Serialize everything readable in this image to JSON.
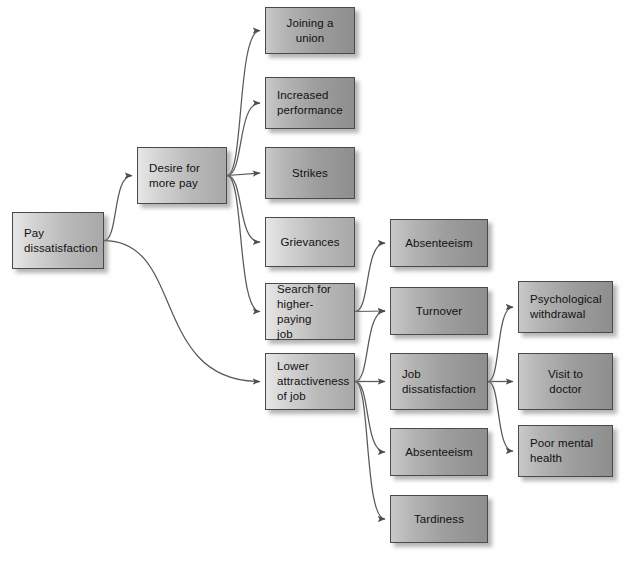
{
  "diagram": {
    "type": "flowchart",
    "box_fill_light": "#d8d8d8",
    "box_fill_dark": "#a8a8a8",
    "box_border": "#4a4a4a",
    "connector_color": "#555555",
    "background": "#ffffff",
    "nodes": [
      {
        "id": "pay_dissatisfaction",
        "label": "Pay\ndissatisfaction",
        "x": 12,
        "y": 212,
        "w": 92,
        "h": 57,
        "shade": "light",
        "align": "left"
      },
      {
        "id": "desire_more_pay",
        "label": "Desire for\nmore pay",
        "x": 137,
        "y": 147,
        "w": 90,
        "h": 57,
        "shade": "light",
        "align": "left"
      },
      {
        "id": "joining_union",
        "label": "Joining a union",
        "x": 265,
        "y": 7,
        "w": 90,
        "h": 47,
        "shade": "dark",
        "align": "center"
      },
      {
        "id": "increased_performance",
        "label": "Increased\nperformance",
        "x": 265,
        "y": 77,
        "w": 90,
        "h": 52,
        "shade": "dark",
        "align": "left"
      },
      {
        "id": "strikes",
        "label": "Strikes",
        "x": 265,
        "y": 147,
        "w": 90,
        "h": 52,
        "shade": "dark",
        "align": "center"
      },
      {
        "id": "grievances",
        "label": "Grievances",
        "x": 265,
        "y": 217,
        "w": 90,
        "h": 50,
        "shade": "light",
        "align": "center"
      },
      {
        "id": "search_higher_paying_job",
        "label": "Search for\nhigher-paying\njob",
        "x": 265,
        "y": 283,
        "w": 90,
        "h": 57,
        "shade": "light",
        "align": "left"
      },
      {
        "id": "lower_attractiveness_of_job",
        "label": "Lower\nattractiveness\nof job",
        "x": 265,
        "y": 353,
        "w": 90,
        "h": 57,
        "shade": "light",
        "align": "left"
      },
      {
        "id": "absenteeism_1",
        "label": "Absenteeism",
        "x": 390,
        "y": 219,
        "w": 98,
        "h": 48,
        "shade": "dark",
        "align": "center"
      },
      {
        "id": "turnover",
        "label": "Turnover",
        "x": 390,
        "y": 287,
        "w": 98,
        "h": 48,
        "shade": "dark",
        "align": "center"
      },
      {
        "id": "job_dissatisfaction",
        "label": "Job\ndissatisfaction",
        "x": 390,
        "y": 353,
        "w": 98,
        "h": 57,
        "shade": "dark",
        "align": "left"
      },
      {
        "id": "absenteeism_2",
        "label": "Absenteeism",
        "x": 390,
        "y": 428,
        "w": 98,
        "h": 48,
        "shade": "dark",
        "align": "center"
      },
      {
        "id": "tardiness",
        "label": "Tardiness",
        "x": 390,
        "y": 495,
        "w": 98,
        "h": 48,
        "shade": "dark",
        "align": "center"
      },
      {
        "id": "psychological_withdrawal",
        "label": "Psychological\nwithdrawal",
        "x": 518,
        "y": 281,
        "w": 95,
        "h": 52,
        "shade": "dark",
        "align": "left"
      },
      {
        "id": "visit_to_doctor",
        "label": "Visit to\ndoctor",
        "x": 518,
        "y": 353,
        "w": 95,
        "h": 57,
        "shade": "dark",
        "align": "center"
      },
      {
        "id": "poor_mental_health",
        "label": "Poor mental\nhealth",
        "x": 518,
        "y": 425,
        "w": 95,
        "h": 52,
        "shade": "dark",
        "align": "left"
      }
    ],
    "edges": [
      {
        "from": "pay_dissatisfaction",
        "to": "desire_more_pay"
      },
      {
        "from": "pay_dissatisfaction",
        "to": "lower_attractiveness_of_job"
      },
      {
        "from": "desire_more_pay",
        "to": "joining_union"
      },
      {
        "from": "desire_more_pay",
        "to": "increased_performance"
      },
      {
        "from": "desire_more_pay",
        "to": "strikes"
      },
      {
        "from": "desire_more_pay",
        "to": "grievances"
      },
      {
        "from": "desire_more_pay",
        "to": "search_higher_paying_job"
      },
      {
        "from": "search_higher_paying_job",
        "to": "absenteeism_1"
      },
      {
        "from": "search_higher_paying_job",
        "to": "turnover"
      },
      {
        "from": "lower_attractiveness_of_job",
        "to": "turnover"
      },
      {
        "from": "lower_attractiveness_of_job",
        "to": "job_dissatisfaction"
      },
      {
        "from": "lower_attractiveness_of_job",
        "to": "absenteeism_2"
      },
      {
        "from": "lower_attractiveness_of_job",
        "to": "tardiness"
      },
      {
        "from": "job_dissatisfaction",
        "to": "psychological_withdrawal"
      },
      {
        "from": "job_dissatisfaction",
        "to": "visit_to_doctor"
      },
      {
        "from": "job_dissatisfaction",
        "to": "poor_mental_health"
      }
    ]
  }
}
